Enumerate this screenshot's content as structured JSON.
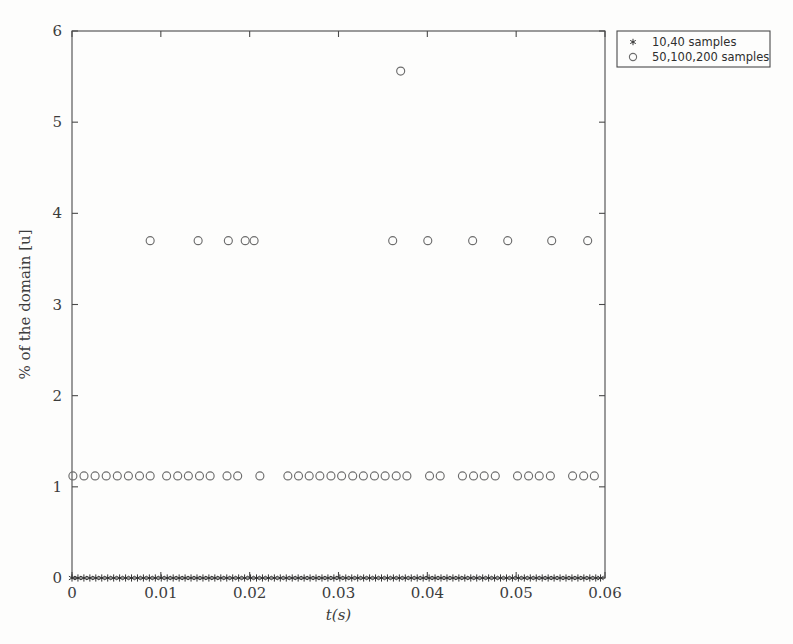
{
  "chart_data": {
    "type": "scatter",
    "title": "",
    "xlabel": "t(s)",
    "ylabel": "% of the domain [u]",
    "xlim": [
      0,
      0.06
    ],
    "ylim": [
      0,
      6
    ],
    "xticks": [
      0,
      0.01,
      0.02,
      0.03,
      0.04,
      0.05,
      0.06
    ],
    "xticklabels": [
      "0",
      "0.01",
      "0.02",
      "0.03",
      "0.04",
      "0.05",
      "0.06"
    ],
    "yticks": [
      0,
      1,
      2,
      3,
      4,
      5,
      6
    ],
    "yticklabels": [
      "0",
      "1",
      "2",
      "3",
      "4",
      "5",
      "6"
    ],
    "grid": false,
    "legend_position": "outside-top-right",
    "series": [
      {
        "name": "10,40 samples",
        "marker": "star",
        "color": "#333333",
        "points": [
          [
            0.0,
            0
          ],
          [
            0.00067,
            0
          ],
          [
            0.00134,
            0
          ],
          [
            0.00201,
            0
          ],
          [
            0.00268,
            0
          ],
          [
            0.00335,
            0
          ],
          [
            0.00402,
            0
          ],
          [
            0.00469,
            0
          ],
          [
            0.00536,
            0
          ],
          [
            0.00603,
            0
          ],
          [
            0.0067,
            0
          ],
          [
            0.00737,
            0
          ],
          [
            0.00804,
            0
          ],
          [
            0.00871,
            0
          ],
          [
            0.00938,
            0
          ],
          [
            0.01005,
            0
          ],
          [
            0.01072,
            0
          ],
          [
            0.01139,
            0
          ],
          [
            0.01206,
            0
          ],
          [
            0.01273,
            0
          ],
          [
            0.0134,
            0
          ],
          [
            0.01407,
            0
          ],
          [
            0.01474,
            0
          ],
          [
            0.01541,
            0
          ],
          [
            0.01608,
            0
          ],
          [
            0.01675,
            0
          ],
          [
            0.01742,
            0
          ],
          [
            0.01809,
            0
          ],
          [
            0.01876,
            0
          ],
          [
            0.01943,
            0
          ],
          [
            0.0201,
            0
          ],
          [
            0.02077,
            0
          ],
          [
            0.02144,
            0
          ],
          [
            0.02211,
            0
          ],
          [
            0.02278,
            0
          ],
          [
            0.02345,
            0
          ],
          [
            0.02412,
            0
          ],
          [
            0.02479,
            0
          ],
          [
            0.02546,
            0
          ],
          [
            0.02613,
            0
          ],
          [
            0.0268,
            0
          ],
          [
            0.02747,
            0
          ],
          [
            0.02814,
            0
          ],
          [
            0.02881,
            0
          ],
          [
            0.02948,
            0
          ],
          [
            0.03015,
            0
          ],
          [
            0.03082,
            0
          ],
          [
            0.03149,
            0
          ],
          [
            0.03216,
            0
          ],
          [
            0.03283,
            0
          ],
          [
            0.0335,
            0
          ],
          [
            0.03417,
            0
          ],
          [
            0.03484,
            0
          ],
          [
            0.03551,
            0
          ],
          [
            0.03618,
            0
          ],
          [
            0.03685,
            0
          ],
          [
            0.03752,
            0
          ],
          [
            0.03819,
            0
          ],
          [
            0.03886,
            0
          ],
          [
            0.03953,
            0
          ],
          [
            0.0402,
            0
          ],
          [
            0.04087,
            0
          ],
          [
            0.04154,
            0
          ],
          [
            0.04221,
            0
          ],
          [
            0.04288,
            0
          ],
          [
            0.04355,
            0
          ],
          [
            0.04422,
            0
          ],
          [
            0.04489,
            0
          ],
          [
            0.04556,
            0
          ],
          [
            0.04623,
            0
          ],
          [
            0.0469,
            0
          ],
          [
            0.04757,
            0
          ],
          [
            0.04824,
            0
          ],
          [
            0.04891,
            0
          ],
          [
            0.04958,
            0
          ],
          [
            0.05025,
            0
          ],
          [
            0.05092,
            0
          ],
          [
            0.05159,
            0
          ],
          [
            0.05226,
            0
          ],
          [
            0.05293,
            0
          ],
          [
            0.0536,
            0
          ],
          [
            0.05427,
            0
          ],
          [
            0.05494,
            0
          ],
          [
            0.05561,
            0
          ],
          [
            0.05628,
            0
          ],
          [
            0.05695,
            0
          ],
          [
            0.05762,
            0
          ],
          [
            0.05829,
            0
          ],
          [
            0.05896,
            0
          ],
          [
            0.0595,
            0
          ]
        ]
      },
      {
        "name": "50,100,200 samples",
        "marker": "circle",
        "color": "#6d6d6d",
        "points": [
          [
            0.0001,
            1.12
          ],
          [
            0.00135,
            1.12
          ],
          [
            0.0026,
            1.12
          ],
          [
            0.00385,
            1.12
          ],
          [
            0.0051,
            1.12
          ],
          [
            0.00635,
            1.12
          ],
          [
            0.0076,
            1.12
          ],
          [
            0.0088,
            1.12
          ],
          [
            0.01065,
            1.12
          ],
          [
            0.0119,
            1.12
          ],
          [
            0.0131,
            1.12
          ],
          [
            0.01435,
            1.12
          ],
          [
            0.01555,
            1.12
          ],
          [
            0.01745,
            1.12
          ],
          [
            0.01865,
            1.12
          ],
          [
            0.02115,
            1.12
          ],
          [
            0.0243,
            1.12
          ],
          [
            0.0255,
            1.12
          ],
          [
            0.0267,
            1.12
          ],
          [
            0.0279,
            1.12
          ],
          [
            0.02915,
            1.12
          ],
          [
            0.03035,
            1.12
          ],
          [
            0.0316,
            1.12
          ],
          [
            0.0328,
            1.12
          ],
          [
            0.03405,
            1.12
          ],
          [
            0.03525,
            1.12
          ],
          [
            0.0365,
            1.12
          ],
          [
            0.0377,
            1.12
          ],
          [
            0.04025,
            1.12
          ],
          [
            0.04145,
            1.12
          ],
          [
            0.04395,
            1.12
          ],
          [
            0.0452,
            1.12
          ],
          [
            0.0464,
            1.12
          ],
          [
            0.04765,
            1.12
          ],
          [
            0.05015,
            1.12
          ],
          [
            0.0514,
            1.12
          ],
          [
            0.0526,
            1.12
          ],
          [
            0.05385,
            1.12
          ],
          [
            0.05635,
            1.12
          ],
          [
            0.0576,
            1.12
          ],
          [
            0.0588,
            1.12
          ],
          [
            0.0088,
            3.7
          ],
          [
            0.0142,
            3.7
          ],
          [
            0.0176,
            3.7
          ],
          [
            0.0195,
            3.7
          ],
          [
            0.0205,
            3.7
          ],
          [
            0.0361,
            3.7
          ],
          [
            0.04005,
            3.7
          ],
          [
            0.0451,
            3.7
          ],
          [
            0.04905,
            3.7
          ],
          [
            0.054,
            3.7
          ],
          [
            0.05805,
            3.7
          ],
          [
            0.037,
            5.56
          ]
        ]
      }
    ]
  },
  "legend": {
    "entries": [
      {
        "marker": "star",
        "label": "10,40 samples"
      },
      {
        "marker": "circle",
        "label": "50,100,200 samples"
      }
    ]
  }
}
